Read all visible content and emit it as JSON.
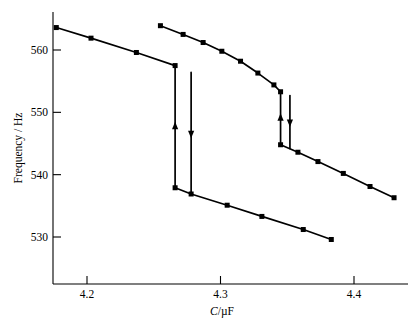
{
  "chart_data": {
    "type": "line",
    "title": "",
    "xlabel": "C/µF",
    "ylabel": "Frequency / Hz",
    "xlim": [
      4.14,
      4.44
    ],
    "ylim": [
      526.5,
      565.5
    ],
    "xticks": [
      4.2,
      4.3,
      4.4
    ],
    "xtick_labels": [
      "4.2",
      "4.3",
      "4.4"
    ],
    "yticks": [
      530,
      540,
      550,
      560
    ],
    "ytick_labels": [
      "530",
      "540",
      "550",
      "560"
    ],
    "grid": false,
    "legend": false,
    "marker": "square",
    "series": [
      {
        "name": "upper-left branch (descending sweep)",
        "x": [
          4.177,
          4.203,
          4.237,
          4.266
        ],
        "y": [
          563.6,
          561.9,
          559.6,
          557.5
        ],
        "comment": "upper resonance branch, left sweep"
      },
      {
        "name": "left jump down (decreasing C sweep)",
        "x": [
          4.266,
          4.266
        ],
        "y": [
          557.5,
          537.9
        ],
        "arrow": "up",
        "comment": "vertical hysteresis transition with upward arrow"
      },
      {
        "name": "left jump up (increasing C sweep)",
        "x": [
          4.278,
          4.278
        ],
        "y": [
          556.4,
          536.9
        ],
        "arrow": "down",
        "comment": "vertical hysteresis transition with downward arrow"
      },
      {
        "name": "lower-left branch (after jump)",
        "x": [
          4.266,
          4.278,
          4.305,
          4.331,
          4.362,
          4.383
        ],
        "y": [
          537.9,
          536.9,
          535.1,
          533.3,
          531.2,
          529.6
        ],
        "comment": "lower branch continuing to right, ends near x-axis"
      },
      {
        "name": "upper-right branch (descending sweep)",
        "x": [
          4.255,
          4.272,
          4.287,
          4.301,
          4.315,
          4.328,
          4.34,
          4.345
        ],
        "y": [
          563.9,
          562.5,
          561.2,
          559.8,
          558.2,
          556.3,
          554.4,
          553.3
        ],
        "comment": "second resonance branch with knee before jump"
      },
      {
        "name": "right jump up (arrow up)",
        "x": [
          4.345,
          4.345
        ],
        "y": [
          553.3,
          544.8
        ],
        "arrow": "up"
      },
      {
        "name": "right jump down (arrow down)",
        "x": [
          4.352,
          4.352
        ],
        "y": [
          552.7,
          544.2
        ],
        "arrow": "down"
      },
      {
        "name": "lower-right branch (after jump)",
        "x": [
          4.345,
          4.358,
          4.373,
          4.392,
          4.412,
          4.43
        ],
        "y": [
          544.8,
          543.6,
          542.1,
          540.2,
          538.1,
          536.3
        ],
        "comment": "final descending segment to right edge"
      }
    ]
  },
  "axes": {
    "y_axis_title": "Frequency / Hz",
    "x_axis_title_italic": "C",
    "x_axis_title_rest": "/µF"
  },
  "colors": {
    "line": "#000000",
    "axis": "#000000",
    "background": "#ffffff",
    "marker": "#000000"
  }
}
